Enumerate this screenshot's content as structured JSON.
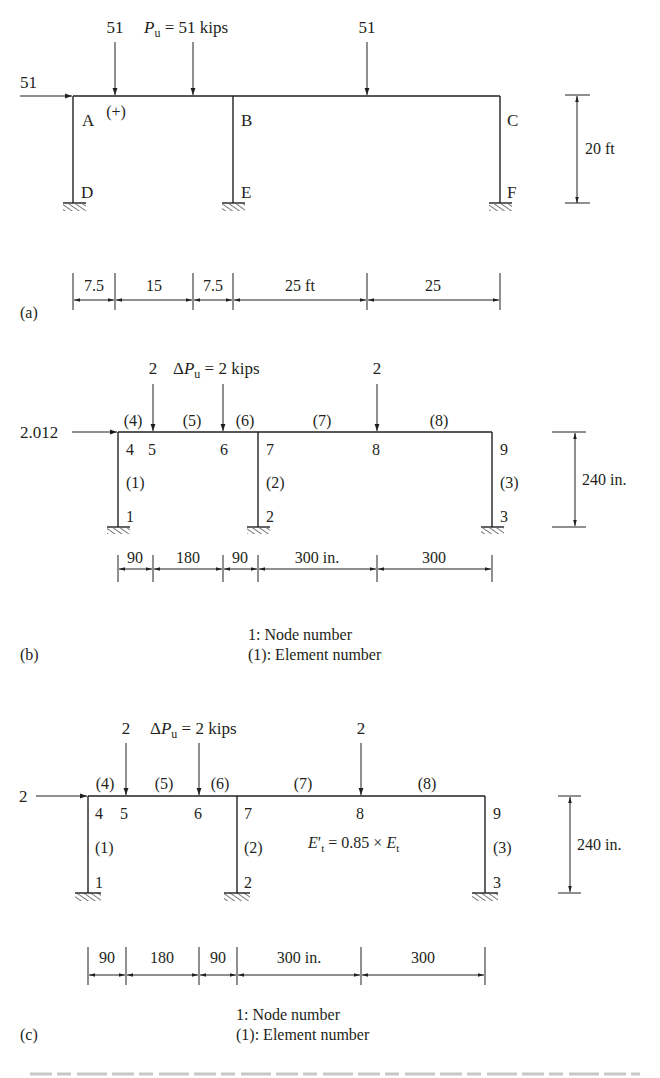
{
  "panels": {
    "a": {
      "label": "(a)",
      "horizontal_load": "51",
      "point_load_left": "51",
      "load_equation_sym": "P",
      "load_equation_sub": "u",
      "load_equation_rest": " = 51 kips",
      "point_load_right": "51",
      "sign_convention": "(+)",
      "joints": {
        "A": "A",
        "B": "B",
        "C": "C",
        "D": "D",
        "E": "E",
        "F": "F"
      },
      "height_dim": "20 ft",
      "span_dims": [
        "7.5",
        "15",
        "7.5",
        "25 ft",
        "25"
      ]
    },
    "b": {
      "label": "(b)",
      "horizontal_load": "2.012",
      "point_load_left": "2",
      "load_equation_delta": "Δ",
      "load_equation_sym": "P",
      "load_equation_sub": "u",
      "load_equation_rest": " = 2 kips",
      "point_load_right": "2",
      "nodes": [
        "1",
        "2",
        "3",
        "4",
        "5",
        "6",
        "7",
        "8",
        "9"
      ],
      "elements": [
        "(1)",
        "(2)",
        "(3)",
        "(4)",
        "(5)",
        "(6)",
        "(7)",
        "(8)"
      ],
      "height_dim": "240 in.",
      "span_dims": [
        "90",
        "180",
        "90",
        "300 in.",
        "300"
      ],
      "legend_node": "1: Node number",
      "legend_element": "(1): Element number"
    },
    "c": {
      "label": "(c)",
      "horizontal_load": "2",
      "point_load_left": "2",
      "load_equation_delta": "Δ",
      "load_equation_sym": "P",
      "load_equation_sub": "u",
      "load_equation_rest": " = 2 kips",
      "point_load_right": "2",
      "nodes": [
        "1",
        "2",
        "3",
        "4",
        "5",
        "6",
        "7",
        "8",
        "9"
      ],
      "elements": [
        "(1)",
        "(2)",
        "(3)",
        "(4)",
        "(5)",
        "(6)",
        "(7)",
        "(8)"
      ],
      "modulus_lhs_sym": "E",
      "modulus_lhs_prime": "′",
      "modulus_lhs_sub": "t",
      "modulus_mid": " = 0.85 × ",
      "modulus_rhs_sym": "E",
      "modulus_rhs_sub": "t",
      "height_dim": "240 in.",
      "span_dims": [
        "90",
        "180",
        "90",
        "300 in.",
        "300"
      ],
      "legend_node": "1: Node number",
      "legend_element": "(1): Element number"
    }
  },
  "colors": {
    "ink": "#231f20",
    "background": "#ffffff"
  }
}
